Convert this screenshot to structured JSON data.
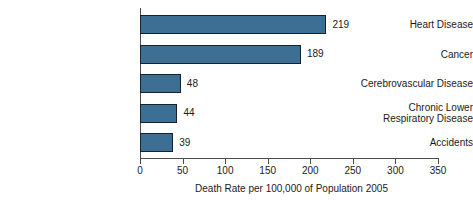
{
  "chart_data": {
    "type": "bar",
    "orientation": "horizontal",
    "title": "",
    "xlabel": "Death Rate per 100,000 of Population 2005",
    "ylabel": "",
    "categories": [
      "Heart Disease",
      "Cancer",
      "Cerebrovascular Disease",
      "Chronic Lower Respiratory Disease",
      "Accidents"
    ],
    "category_lines": [
      [
        "Heart Disease"
      ],
      [
        "Cancer"
      ],
      [
        "Cerebrovascular Disease"
      ],
      [
        "Chronic Lower",
        "Respiratory Disease"
      ],
      [
        "Accidents"
      ]
    ],
    "values": [
      219,
      189,
      48,
      44,
      39
    ],
    "value_labels": [
      "219",
      "189",
      "48",
      "44",
      "39"
    ],
    "xlim": [
      0,
      350
    ],
    "xticks": [
      0,
      50,
      100,
      150,
      200,
      250,
      300,
      350
    ],
    "xtick_labels": [
      "0",
      "50",
      "100",
      "150",
      "200",
      "250",
      "300",
      "350"
    ],
    "grid": false,
    "legend": false,
    "bar_color": "#3d6e93",
    "bar_edge_color": "#16222c",
    "axis_color": "#4a4a4a",
    "background_color": "#ffffff"
  }
}
